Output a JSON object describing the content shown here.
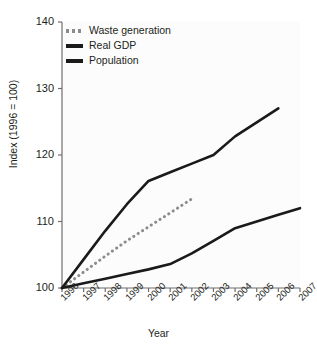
{
  "chart_data": {
    "type": "line",
    "title": "",
    "xlabel": "Year",
    "ylabel": "Index (1996 = 100)",
    "x": [
      1996,
      1997,
      1998,
      1999,
      2000,
      2001,
      2002,
      2003,
      2004,
      2005,
      2006,
      2007
    ],
    "xticklabels": [
      "1996",
      "1997",
      "1998",
      "1999",
      "2000",
      "2001",
      "2002",
      "2003",
      "2004",
      "2005",
      "2006",
      "2007"
    ],
    "yticks": [
      100,
      110,
      120,
      130,
      140
    ],
    "yticklabels": [
      "100",
      "110",
      "120",
      "130",
      "140"
    ],
    "xlim": [
      1996,
      2007
    ],
    "ylim": [
      100,
      140
    ],
    "grid": false,
    "legend_position": "top-left",
    "series": [
      {
        "name": "Waste generation",
        "style": "dotted",
        "color": "#8c8c8c",
        "x": [
          1996,
          1997,
          1998,
          1999,
          2000,
          2001,
          2002
        ],
        "values": [
          100.0,
          102.4,
          104.8,
          107.1,
          109.2,
          111.3,
          113.4
        ]
      },
      {
        "name": "Real GDP",
        "style": "solid",
        "color": "#1a1a1a",
        "x": [
          1996,
          1997,
          1998,
          1999,
          2000,
          2001,
          2002,
          2003,
          2004,
          2005,
          2006
        ],
        "values": [
          100.0,
          104.3,
          108.6,
          112.6,
          116.1,
          117.4,
          118.7,
          120.0,
          122.8,
          124.9,
          127.0
        ]
      },
      {
        "name": "Population",
        "style": "solid",
        "color": "#1a1a1a",
        "x": [
          1996,
          1997,
          1998,
          1999,
          2000,
          2001,
          2002,
          2003,
          2004,
          2005,
          2006,
          2007
        ],
        "values": [
          100.0,
          100.7,
          101.4,
          102.1,
          102.8,
          103.6,
          105.2,
          107.1,
          109.0,
          110.0,
          111.0,
          112.0
        ]
      }
    ]
  },
  "legend": {
    "items": [
      {
        "label": "Waste generation",
        "swatch": "dotted",
        "color": "#8c8c8c"
      },
      {
        "label": "Real GDP",
        "swatch": "solid",
        "color": "#1a1a1a"
      },
      {
        "label": "Population",
        "swatch": "solid",
        "color": "#1a1a1a"
      }
    ]
  },
  "axes": {
    "ylabel": "Index (1996 = 100)",
    "xlabel": "Year",
    "axis_color": "#6e6e6e",
    "plot_background": "#fcfcfc"
  }
}
